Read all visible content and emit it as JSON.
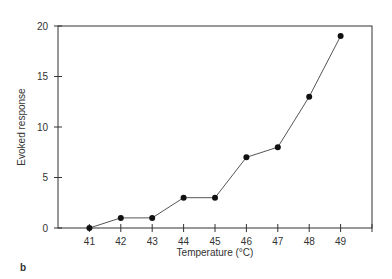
{
  "chart_data": {
    "type": "line",
    "title": "",
    "xlabel": "Temperature (°C)",
    "ylabel": "Evoked response",
    "x": [
      41,
      42,
      43,
      44,
      45,
      46,
      47,
      48,
      49
    ],
    "series": [
      {
        "name": "Evoked response",
        "values": [
          0,
          1,
          1,
          3,
          3,
          7,
          8,
          13,
          19
        ]
      }
    ],
    "xticks": [
      "41",
      "42",
      "43",
      "44",
      "45",
      "46",
      "47",
      "48",
      "49"
    ],
    "yticks": [
      "0",
      "5",
      "10",
      "15",
      "20"
    ],
    "xlim": [
      40,
      50
    ],
    "ylim": [
      0,
      20
    ],
    "grid": false,
    "legend": "none",
    "markers": "filled-circle",
    "panel_label": "b"
  },
  "colors": {
    "line": "#555555",
    "marker": "#111111",
    "axis": "#333333"
  }
}
